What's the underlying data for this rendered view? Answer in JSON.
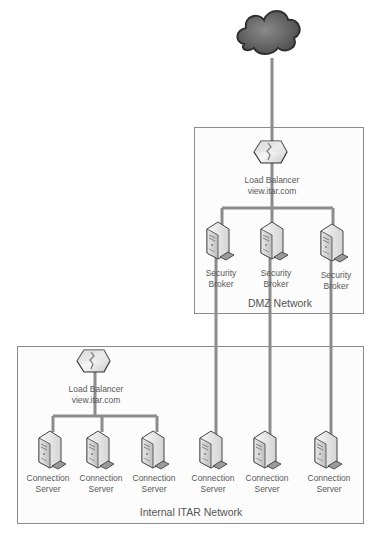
{
  "colors": {
    "line": "#8c8c8c",
    "zone_border": "#8a8a8a",
    "zone_fill": "#fbfbfb",
    "text": "#595959",
    "cloud": "#6e6e6e"
  },
  "cloud": {
    "label": ""
  },
  "dmz": {
    "zone_label": "DMZ Network",
    "load_balancer": {
      "line1": "Load Balancer",
      "line2": "view.itar.com"
    },
    "brokers": [
      {
        "line1": "Security",
        "line2": "Broker"
      },
      {
        "line1": "Security",
        "line2": "Broker"
      },
      {
        "line1": "Security",
        "line2": "Broker"
      }
    ]
  },
  "internal": {
    "zone_label": "Internal ITAR Network",
    "load_balancer": {
      "line1": "Load Balancer",
      "line2": "view.itar.com"
    },
    "servers": [
      {
        "line1": "Connection",
        "line2": "Server"
      },
      {
        "line1": "Connection",
        "line2": "Server"
      },
      {
        "line1": "Connection",
        "line2": "Server"
      },
      {
        "line1": "Connection",
        "line2": "Server"
      },
      {
        "line1": "Connection",
        "line2": "Server"
      },
      {
        "line1": "Connection",
        "line2": "Server"
      }
    ]
  }
}
